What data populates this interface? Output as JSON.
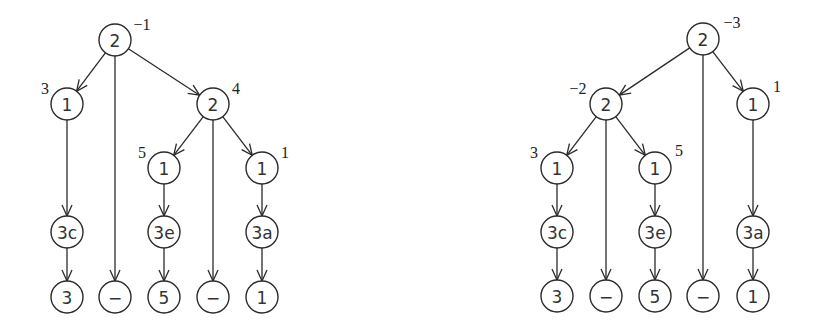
{
  "trees": [
    {
      "name": "left-tree",
      "nodes": [
        {
          "id": "r",
          "label": "2",
          "annotation": "−1"
        },
        {
          "id": "a",
          "label": "1",
          "annotation": "3"
        },
        {
          "id": "b",
          "label": "2",
          "annotation": "4"
        },
        {
          "id": "b1",
          "label": "1",
          "annotation": "5"
        },
        {
          "id": "b2",
          "label": "1",
          "annotation": "1"
        },
        {
          "id": "c3c",
          "label": "3c",
          "annotation": ""
        },
        {
          "id": "c3e",
          "label": "3e",
          "annotation": ""
        },
        {
          "id": "c3a",
          "label": "3a",
          "annotation": ""
        },
        {
          "id": "l1",
          "label": "3",
          "annotation": ""
        },
        {
          "id": "l2",
          "label": "−",
          "annotation": ""
        },
        {
          "id": "l3",
          "label": "5",
          "annotation": ""
        },
        {
          "id": "l4",
          "label": "−",
          "annotation": ""
        },
        {
          "id": "l5",
          "label": "1",
          "annotation": ""
        }
      ],
      "edges": [
        [
          "r",
          "a"
        ],
        [
          "r",
          "l2"
        ],
        [
          "r",
          "b"
        ],
        [
          "a",
          "c3c"
        ],
        [
          "c3c",
          "l1"
        ],
        [
          "b",
          "b1"
        ],
        [
          "b",
          "l4"
        ],
        [
          "b",
          "b2"
        ],
        [
          "b1",
          "c3e"
        ],
        [
          "c3e",
          "l3"
        ],
        [
          "b2",
          "c3a"
        ],
        [
          "c3a",
          "l5"
        ]
      ]
    },
    {
      "name": "right-tree",
      "nodes": [
        {
          "id": "r",
          "label": "2",
          "annotation": "−3"
        },
        {
          "id": "a",
          "label": "2",
          "annotation": "−2"
        },
        {
          "id": "b",
          "label": "1",
          "annotation": "1"
        },
        {
          "id": "a1",
          "label": "1",
          "annotation": "3"
        },
        {
          "id": "a2",
          "label": "1",
          "annotation": "5"
        },
        {
          "id": "c3c",
          "label": "3c",
          "annotation": ""
        },
        {
          "id": "c3e",
          "label": "3e",
          "annotation": ""
        },
        {
          "id": "c3a",
          "label": "3a",
          "annotation": ""
        },
        {
          "id": "l1",
          "label": "3",
          "annotation": ""
        },
        {
          "id": "l2",
          "label": "−",
          "annotation": ""
        },
        {
          "id": "l3",
          "label": "5",
          "annotation": ""
        },
        {
          "id": "l4",
          "label": "−",
          "annotation": ""
        },
        {
          "id": "l5",
          "label": "1",
          "annotation": ""
        }
      ],
      "edges": [
        [
          "r",
          "a"
        ],
        [
          "r",
          "l4"
        ],
        [
          "r",
          "b"
        ],
        [
          "a",
          "a1"
        ],
        [
          "a",
          "l2"
        ],
        [
          "a",
          "a2"
        ],
        [
          "a1",
          "c3c"
        ],
        [
          "c3c",
          "l1"
        ],
        [
          "a2",
          "c3e"
        ],
        [
          "c3e",
          "l3"
        ],
        [
          "b",
          "c3a"
        ],
        [
          "c3a",
          "l5"
        ]
      ]
    }
  ]
}
